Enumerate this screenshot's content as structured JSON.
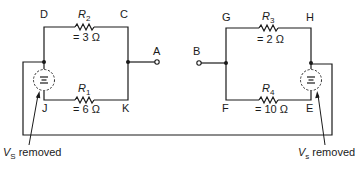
{
  "diagram": {
    "type": "circuit-schematic",
    "nodes": {
      "D": "D",
      "C": "C",
      "A": "A",
      "B": "B",
      "G": "G",
      "H": "H",
      "J": "J",
      "K": "K",
      "F": "F",
      "E": "E"
    },
    "resistors": [
      {
        "name": "R",
        "sub": "2",
        "value": "= 3 Ω",
        "between": "D-C"
      },
      {
        "name": "R",
        "sub": "1",
        "value": "= 6 Ω",
        "between": "J-K"
      },
      {
        "name": "R",
        "sub": "3",
        "value": "= 2 Ω",
        "between": "G-H"
      },
      {
        "name": "R",
        "sub": "4",
        "value": "= 10 Ω",
        "between": "F-E"
      }
    ],
    "sources": [
      {
        "name": "V",
        "sub": "S",
        "note": "removed",
        "position": "left branch D-J"
      },
      {
        "name": "V",
        "sub": "s",
        "note": "removed",
        "position": "right branch H-E"
      }
    ],
    "terminals": [
      "A",
      "B"
    ]
  }
}
